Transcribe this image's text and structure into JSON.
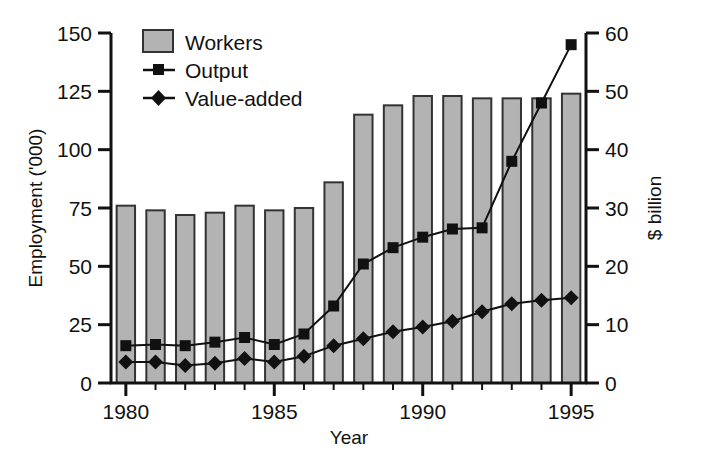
{
  "chart_data": {
    "type": "bar",
    "title": "",
    "subtitle": "",
    "xlabel": "Year",
    "ylabel": "Employment ('000)",
    "y2label": "$ billion",
    "grid": false,
    "legend_position": "top-left",
    "x": [
      1980,
      1981,
      1982,
      1983,
      1984,
      1985,
      1986,
      1987,
      1988,
      1989,
      1990,
      1991,
      1992,
      1993,
      1994,
      1995
    ],
    "categories": [
      "1980",
      "1981",
      "1982",
      "1983",
      "1984",
      "1985",
      "1986",
      "1987",
      "1988",
      "1989",
      "1990",
      "1991",
      "1992",
      "1993",
      "1994",
      "1995"
    ],
    "xlim": [
      1979.5,
      1995.5
    ],
    "ylim": [
      0,
      150
    ],
    "y2lim": [
      0,
      60
    ],
    "xticks": [
      1980,
      1985,
      1990,
      1995
    ],
    "xtick_labels": [
      "1980",
      "1985",
      "1990",
      "1995"
    ],
    "xminor_ticks": [
      1981,
      1982,
      1983,
      1984,
      1986,
      1987,
      1988,
      1989,
      1991,
      1992,
      1993,
      1994
    ],
    "yticks": [
      0,
      25,
      50,
      75,
      100,
      125,
      150
    ],
    "ytick_labels": [
      "0",
      "25",
      "50",
      "75",
      "100",
      "125",
      "150"
    ],
    "y2ticks": [
      0,
      10,
      20,
      30,
      40,
      50,
      60
    ],
    "y2tick_labels": [
      "0",
      "10",
      "20",
      "30",
      "40",
      "50",
      "60"
    ],
    "series": [
      {
        "name": "Workers",
        "kind": "bar",
        "axis": "left",
        "unit": "'000",
        "fill": "#b3b3b3",
        "stroke": "#333333",
        "values": [
          76,
          74,
          72,
          73,
          76,
          74,
          75,
          86,
          115,
          119,
          123,
          123,
          122,
          122,
          122,
          124
        ]
      },
      {
        "name": "Output",
        "kind": "line",
        "marker": "square",
        "axis": "right",
        "unit": "$ billion",
        "stroke": "#111111",
        "values": [
          6.4,
          6.6,
          6.4,
          7.0,
          7.8,
          6.6,
          8.4,
          13.2,
          20.4,
          23.2,
          25.0,
          26.4,
          26.6,
          38.0,
          48.0,
          58.0
        ],
        "values_left_scale": [
          16,
          16.5,
          16,
          17.5,
          19.5,
          16.5,
          21,
          33,
          51,
          58,
          62.5,
          66,
          66.5,
          95,
          120,
          145
        ]
      },
      {
        "name": "Value-added",
        "kind": "line",
        "marker": "diamond",
        "axis": "right",
        "unit": "$ billion",
        "stroke": "#111111",
        "values": [
          3.6,
          3.6,
          3.0,
          3.4,
          4.2,
          3.6,
          4.6,
          6.4,
          7.6,
          8.8,
          9.6,
          10.6,
          12.2,
          13.6,
          14.2,
          14.6
        ],
        "values_left_scale": [
          9,
          9,
          7.5,
          8.5,
          10.5,
          9,
          11.5,
          16,
          19,
          22,
          24,
          26.5,
          30.5,
          34,
          35.5,
          36.5
        ]
      }
    ]
  },
  "legend": {
    "items": [
      {
        "label": "Workers",
        "swatch": "bar-swatch"
      },
      {
        "label": "Output",
        "swatch": "line-square-swatch"
      },
      {
        "label": "Value-added",
        "swatch": "line-diamond-swatch"
      }
    ]
  },
  "axes": {
    "left_title": "Employment ('000)",
    "right_title": "$ billion",
    "bottom_title": "Year"
  },
  "colors": {
    "bar_fill": "#b3b3b3",
    "bar_stroke": "#333333",
    "line": "#111111",
    "axis": "#111111",
    "background": "#ffffff"
  }
}
